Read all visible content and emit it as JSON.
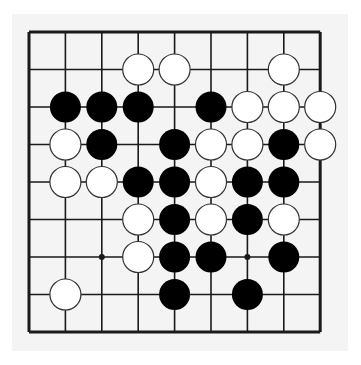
{
  "board": {
    "size": 9,
    "origin": {
      "x": 29,
      "y": 32
    },
    "spacing": {
      "x": 36.4,
      "y": 37.5
    },
    "stone_radius": 15.5,
    "colors": {
      "paper": "#f4f4f4",
      "line": "#1a1a1a",
      "black_stone": "#000000",
      "white_stone": "#ffffff",
      "white_stone_edge": "#333333"
    },
    "star_points": [
      [
        2,
        6
      ],
      [
        6,
        6
      ]
    ],
    "stones": [
      {
        "col": 3,
        "row": 1,
        "color": "white"
      },
      {
        "col": 4,
        "row": 1,
        "color": "white"
      },
      {
        "col": 7,
        "row": 1,
        "color": "white"
      },
      {
        "col": 1,
        "row": 2,
        "color": "black"
      },
      {
        "col": 2,
        "row": 2,
        "color": "black"
      },
      {
        "col": 3,
        "row": 2,
        "color": "black"
      },
      {
        "col": 5,
        "row": 2,
        "color": "black"
      },
      {
        "col": 6,
        "row": 2,
        "color": "white"
      },
      {
        "col": 7,
        "row": 2,
        "color": "white"
      },
      {
        "col": 8,
        "row": 2,
        "color": "white"
      },
      {
        "col": 1,
        "row": 3,
        "color": "white"
      },
      {
        "col": 2,
        "row": 3,
        "color": "black"
      },
      {
        "col": 4,
        "row": 3,
        "color": "black"
      },
      {
        "col": 5,
        "row": 3,
        "color": "white"
      },
      {
        "col": 6,
        "row": 3,
        "color": "white"
      },
      {
        "col": 7,
        "row": 3,
        "color": "black"
      },
      {
        "col": 8,
        "row": 3,
        "color": "white"
      },
      {
        "col": 1,
        "row": 4,
        "color": "white"
      },
      {
        "col": 2,
        "row": 4,
        "color": "white"
      },
      {
        "col": 3,
        "row": 4,
        "color": "black"
      },
      {
        "col": 4,
        "row": 4,
        "color": "black"
      },
      {
        "col": 5,
        "row": 4,
        "color": "white"
      },
      {
        "col": 6,
        "row": 4,
        "color": "black"
      },
      {
        "col": 7,
        "row": 4,
        "color": "black"
      },
      {
        "col": 3,
        "row": 5,
        "color": "white"
      },
      {
        "col": 4,
        "row": 5,
        "color": "black"
      },
      {
        "col": 5,
        "row": 5,
        "color": "white"
      },
      {
        "col": 6,
        "row": 5,
        "color": "black"
      },
      {
        "col": 7,
        "row": 5,
        "color": "white"
      },
      {
        "col": 3,
        "row": 6,
        "color": "white"
      },
      {
        "col": 4,
        "row": 6,
        "color": "black"
      },
      {
        "col": 5,
        "row": 6,
        "color": "black"
      },
      {
        "col": 7,
        "row": 6,
        "color": "black"
      },
      {
        "col": 1,
        "row": 7,
        "color": "white"
      },
      {
        "col": 4,
        "row": 7,
        "color": "black"
      },
      {
        "col": 6,
        "row": 7,
        "color": "black"
      }
    ]
  }
}
